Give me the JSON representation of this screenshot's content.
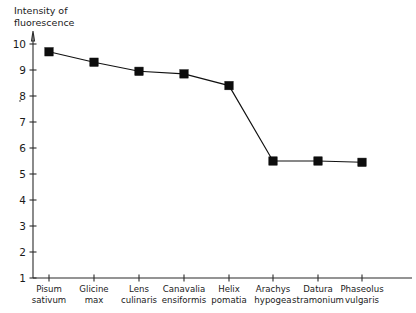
{
  "chart_data": {
    "type": "line",
    "title": "",
    "xlabel": "",
    "ylabel": "Intensity of fluorescence",
    "ylabel_line1": "Intensity of",
    "ylabel_line2": "fluorescence",
    "ylim": [
      0,
      10.6
    ],
    "ytick_values": [
      1,
      2,
      3,
      4,
      5,
      6,
      7,
      8,
      9,
      10
    ],
    "ytick_labels": [
      "1",
      "2",
      "3",
      "4",
      "5",
      "6",
      "7",
      "8",
      "9",
      "10"
    ],
    "grid": false,
    "legend": "none",
    "marker": "square",
    "series_color": "#0d0d0d",
    "categories": [
      "Pisum sativum",
      "Glicine max",
      "Lens culinaris",
      "Canavalia ensiformis",
      "Helix pomatia",
      "Arachys hypogea",
      "Datura stramonium",
      "Phaseolus vulgaris"
    ],
    "category_lines": [
      [
        "Pisum",
        "sativum"
      ],
      [
        "Glicine",
        "max"
      ],
      [
        "Lens",
        "culinaris"
      ],
      [
        "Canavalia",
        "ensiformis"
      ],
      [
        "Helix",
        "pomatia"
      ],
      [
        "Arachys",
        "hypogea"
      ],
      [
        "Datura",
        "stramonium"
      ],
      [
        "Phaseolus",
        "vulgaris"
      ]
    ],
    "values": [
      9.7,
      9.3,
      8.95,
      8.85,
      8.4,
      5.5,
      5.5,
      5.45
    ]
  }
}
